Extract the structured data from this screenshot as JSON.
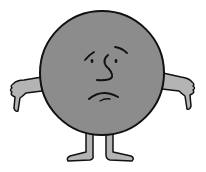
{
  "illustration": {
    "subject": "sad round cartoon character giving thumbs down",
    "alt": "Sad gray circle character with thumbs down",
    "colors": {
      "background": "#ffffff",
      "body": "#8c8c8c",
      "limbs": "#b4b4b4",
      "outline": "#111111"
    },
    "parts": {
      "body": "body-circle",
      "face": [
        "left-eyebrow",
        "right-eyebrow",
        "left-eye",
        "right-eye",
        "nose",
        "frown-mouth"
      ],
      "arms": [
        "left-arm-thumbs-down",
        "right-arm-thumbs-down"
      ],
      "legs": [
        "left-leg",
        "right-leg"
      ]
    }
  }
}
